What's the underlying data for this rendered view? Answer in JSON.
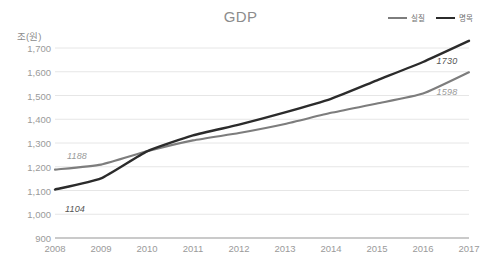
{
  "chart_data": {
    "type": "line",
    "title": "GDP",
    "xlabel": "",
    "ylabel": "조(원)",
    "x": [
      2008,
      2009,
      2010,
      2011,
      2012,
      2013,
      2014,
      2015,
      2016,
      2017
    ],
    "categories": [
      "2008",
      "2009",
      "2010",
      "2011",
      "2012",
      "2013",
      "2014",
      "2015",
      "2016",
      "2017"
    ],
    "ylim": [
      900,
      1730
    ],
    "yticks": [
      900,
      1000,
      1100,
      1200,
      1300,
      1400,
      1500,
      1600,
      1700
    ],
    "ytick_labels": [
      "900",
      "1,000",
      "1,100",
      "1,200",
      "1,300",
      "1,400",
      "1,500",
      "1,600",
      "1,700"
    ],
    "grid": true,
    "legend_position": "top-right",
    "series": [
      {
        "name": "실질",
        "color": "#7d7d7d",
        "values": [
          1188,
          1209,
          1265,
          1311,
          1342,
          1380,
          1427,
          1466,
          1508,
          1598
        ]
      },
      {
        "name": "명목",
        "color": "#2b2b2b",
        "values": [
          1104,
          1151,
          1265,
          1332,
          1377,
          1429,
          1486,
          1564,
          1641,
          1730
        ]
      }
    ],
    "annotations": [
      {
        "text": "1188",
        "series": "실질",
        "x": 2008,
        "value": 1188,
        "color": "#9a9a9a"
      },
      {
        "text": "1104",
        "series": "명목",
        "x": 2008,
        "value": 1104,
        "color": "#555555"
      },
      {
        "text": "1730",
        "series": "명목",
        "x": 2017,
        "value": 1730,
        "color": "#555555"
      },
      {
        "text": "1598",
        "series": "실질",
        "x": 2017,
        "value": 1598,
        "color": "#9a9a9a"
      }
    ]
  },
  "legend": {
    "items": [
      {
        "label": "실질",
        "color": "#7d7d7d"
      },
      {
        "label": "명목",
        "color": "#2b2b2b"
      }
    ]
  }
}
